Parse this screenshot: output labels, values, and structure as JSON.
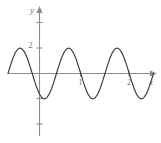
{
  "figure": {
    "background_color": "#ffffff",
    "axis_color": "#8c8c8c",
    "curve_color": "#3b3b3b",
    "label_color": "#6f6f6f",
    "x_axis_name": "x",
    "y_axis_name": "y"
  },
  "chart_data": {
    "type": "line",
    "title": "",
    "subtitle": "",
    "xlabel": "x",
    "ylabel": "y",
    "grid": false,
    "legend": null,
    "x_tick_labels": [
      "1",
      "2"
    ],
    "x_tick_values": [
      1,
      2
    ],
    "y_tick_labels": [
      "2"
    ],
    "y_tick_values": [
      2
    ],
    "xlim": [
      -0.65,
      2.35
    ],
    "ylim": [
      -3.3,
      3.7
    ],
    "annotations": [],
    "series": [
      {
        "name": "sinusoid",
        "equation": "y = 2 cos(2π(x + 0.35))",
        "amplitude": 2,
        "period": 1,
        "x": [
          -0.65,
          -0.6,
          -0.55,
          -0.5,
          -0.45,
          -0.4,
          -0.35,
          -0.3,
          -0.25,
          -0.2,
          -0.15,
          -0.1,
          -0.05,
          0.0,
          0.05,
          0.1,
          0.15,
          0.2,
          0.25,
          0.3,
          0.35,
          0.4,
          0.45,
          0.5,
          0.55,
          0.6,
          0.65,
          0.7,
          0.75,
          0.8,
          0.85,
          0.9,
          0.95,
          1.0,
          1.05,
          1.1,
          1.15,
          1.2,
          1.25,
          1.3,
          1.35,
          1.4,
          1.45,
          1.5,
          1.55,
          1.6,
          1.65,
          1.7,
          1.75,
          1.8,
          1.85,
          1.9,
          1.95,
          2.0,
          2.05,
          2.1,
          2.15,
          2.2,
          2.25,
          2.3,
          2.35
        ],
        "y": [
          0.0,
          0.62,
          1.18,
          1.62,
          1.9,
          2.0,
          1.9,
          1.62,
          1.18,
          0.62,
          0.0,
          -0.62,
          -1.18,
          -1.62,
          -1.9,
          -2.0,
          -1.9,
          -1.62,
          -1.18,
          -0.62,
          0.0,
          0.62,
          1.18,
          1.62,
          1.9,
          2.0,
          1.9,
          1.62,
          1.18,
          0.62,
          0.0,
          -0.62,
          -1.18,
          -1.62,
          -1.9,
          -2.0,
          -1.9,
          -1.62,
          -1.18,
          -0.62,
          0.0,
          0.62,
          1.18,
          1.62,
          1.9,
          2.0,
          1.9,
          1.62,
          1.18,
          0.62,
          0.0,
          -0.62,
          -1.18,
          -1.62,
          -1.9,
          -2.0,
          -1.9,
          -1.62,
          -1.18,
          -0.62,
          0.0
        ]
      }
    ],
    "zero_crossings": [
      -0.65,
      -0.15,
      0.35,
      0.85,
      1.35,
      1.85,
      2.35
    ],
    "maxima": [
      {
        "x": -0.4,
        "y": 2
      },
      {
        "x": 0.6,
        "y": 2
      },
      {
        "x": 1.6,
        "y": 2
      }
    ],
    "minima": [
      {
        "x": 0.1,
        "y": -2
      },
      {
        "x": 1.1,
        "y": -2
      },
      {
        "x": 2.1,
        "y": -2
      }
    ]
  }
}
